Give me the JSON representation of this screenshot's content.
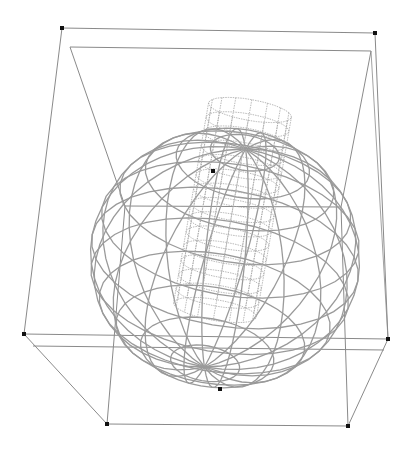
{
  "scene": {
    "title": "",
    "background": "#ffffff",
    "colors": {
      "box_line": "#8a8a8a",
      "sphere_line": "#9a9a9a",
      "cylinder_line": "#a8a8a8",
      "marker": "#111111"
    },
    "bounding_box": {
      "outer_corners": {
        "top_left": [
          62,
          28
        ],
        "top_right": [
          375,
          33
        ],
        "mid_left": [
          24,
          334
        ],
        "mid_right": [
          388,
          339
        ],
        "bottom_left": [
          107,
          424
        ],
        "bottom_right": [
          348,
          426
        ]
      },
      "inner_corners": {
        "top_left": [
          70,
          47
        ],
        "top_right": [
          371,
          51
        ],
        "center_left": [
          125,
          206
        ],
        "center_right": [
          341,
          207
        ],
        "low_left": [
          33,
          346
        ],
        "low_right": [
          384,
          350
        ]
      }
    },
    "sphere": {
      "center": [
        225,
        258
      ],
      "rx": 135,
      "ry": 130,
      "pole_bottom": [
        202,
        331
      ],
      "pole_top": [
        262,
        165
      ],
      "meridians": 18,
      "parallels": 12
    },
    "cylinder": {
      "top": [
        250,
        110
      ],
      "bottom": [
        215,
        310
      ],
      "radius": 42,
      "rings": 14,
      "segments": 16
    },
    "markers": [
      [
        62,
        28
      ],
      [
        375,
        33
      ],
      [
        24,
        334
      ],
      [
        388,
        339
      ],
      [
        107,
        424
      ],
      [
        348,
        426
      ],
      [
        213,
        171
      ],
      [
        220,
        389
      ]
    ]
  }
}
